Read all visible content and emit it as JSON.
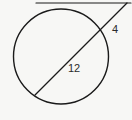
{
  "figure": {
    "background_color": "#f7f7f5",
    "stroke_color": "#1a1a1a",
    "label_color": "#2b2b2b",
    "labels": {
      "chord": "12",
      "external_segment": "4"
    },
    "elements": {
      "circle_name": "circle",
      "tangent_name": "tangent-line",
      "secant_name": "secant-line"
    }
  },
  "chart_data": {
    "type": "diagram",
    "subtype": "euclidean-geometry",
    "xlim": [
      0,
      132
    ],
    "ylim": [
      0,
      120
    ],
    "grid": false,
    "legend": null,
    "shapes": [
      {
        "name": "circle",
        "kind": "circle",
        "cx": 61,
        "cy": 56.5,
        "r": 47.5,
        "stroke": "#1a1a1a",
        "stroke_width": 1.4,
        "fill": "none"
      },
      {
        "name": "tangent-line",
        "kind": "line",
        "x1": 36,
        "y1": 3,
        "x2": 131,
        "y2": 3,
        "stroke": "#1a1a1a",
        "stroke_width": 1.2
      },
      {
        "name": "secant-line",
        "kind": "line",
        "x1": 35,
        "y1": 95,
        "x2": 127,
        "y2": 3,
        "stroke": "#1a1a1a",
        "stroke_width": 1.3
      }
    ],
    "annotations": [
      {
        "name": "chord-length-label",
        "text": "12",
        "x": 73,
        "y": 69,
        "describes": "chord of the secant inside the circle"
      },
      {
        "name": "external-segment-label",
        "text": "4",
        "x": 116,
        "y": 30,
        "describes": "external secant segment from circle to external point"
      }
    ]
  }
}
